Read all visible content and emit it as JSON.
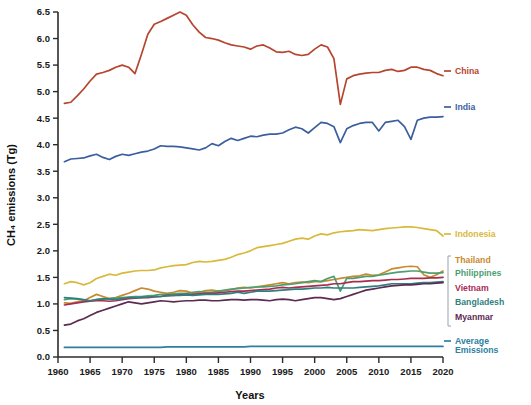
{
  "chart_data": {
    "type": "line",
    "title": "",
    "xlabel": "Years",
    "ylabel": "CH₄ emissions (Tg)",
    "xlim": [
      1960,
      2020
    ],
    "ylim": [
      0.0,
      6.5
    ],
    "xticks": [
      1960,
      1965,
      1970,
      1975,
      1980,
      1985,
      1990,
      1995,
      2000,
      2005,
      2010,
      2015,
      2020
    ],
    "yticks": [
      "0.0",
      "0.5",
      "1.0",
      "1.5",
      "2.0",
      "2.5",
      "3.0",
      "3.5",
      "4.0",
      "4.5",
      "5.0",
      "5.5",
      "6.0",
      "6.5"
    ],
    "grid": false,
    "legend_position": "right-inline",
    "x": [
      1961,
      1962,
      1963,
      1964,
      1965,
      1966,
      1967,
      1968,
      1969,
      1970,
      1971,
      1972,
      1973,
      1974,
      1975,
      1976,
      1977,
      1978,
      1979,
      1980,
      1981,
      1982,
      1983,
      1984,
      1985,
      1986,
      1987,
      1988,
      1989,
      1990,
      1991,
      1992,
      1993,
      1994,
      1995,
      1996,
      1997,
      1998,
      1999,
      2000,
      2001,
      2002,
      2003,
      2004,
      2005,
      2006,
      2007,
      2008,
      2009,
      2010,
      2011,
      2012,
      2013,
      2014,
      2015,
      2016,
      2017,
      2018,
      2019,
      2020
    ],
    "series": [
      {
        "name": "China",
        "color": "#b5452f",
        "values": [
          4.78,
          4.8,
          4.92,
          5.05,
          5.2,
          5.33,
          5.36,
          5.4,
          5.46,
          5.5,
          5.46,
          5.34,
          5.7,
          6.08,
          6.27,
          6.32,
          6.38,
          6.44,
          6.5,
          6.44,
          6.26,
          6.12,
          6.02,
          6.0,
          5.97,
          5.92,
          5.88,
          5.86,
          5.84,
          5.8,
          5.86,
          5.88,
          5.82,
          5.75,
          5.74,
          5.76,
          5.7,
          5.68,
          5.7,
          5.8,
          5.88,
          5.84,
          5.62,
          4.76,
          5.24,
          5.3,
          5.33,
          5.35,
          5.36,
          5.36,
          5.4,
          5.42,
          5.38,
          5.4,
          5.46,
          5.46,
          5.42,
          5.4,
          5.34,
          5.3
        ]
      },
      {
        "name": "India",
        "color": "#3b5f9e",
        "values": [
          3.68,
          3.73,
          3.74,
          3.75,
          3.79,
          3.82,
          3.76,
          3.72,
          3.78,
          3.82,
          3.8,
          3.83,
          3.86,
          3.88,
          3.92,
          3.98,
          3.97,
          3.97,
          3.96,
          3.94,
          3.92,
          3.9,
          3.94,
          4.02,
          3.98,
          4.06,
          4.12,
          4.08,
          4.12,
          4.16,
          4.15,
          4.18,
          4.2,
          4.2,
          4.22,
          4.28,
          4.33,
          4.3,
          4.22,
          4.32,
          4.42,
          4.4,
          4.34,
          4.04,
          4.3,
          4.36,
          4.4,
          4.42,
          4.42,
          4.26,
          4.42,
          4.44,
          4.46,
          4.34,
          4.1,
          4.46,
          4.5,
          4.52,
          4.52,
          4.53
        ]
      },
      {
        "name": "Indonesia",
        "color": "#d9b93c",
        "values": [
          1.38,
          1.42,
          1.4,
          1.36,
          1.4,
          1.48,
          1.52,
          1.56,
          1.54,
          1.58,
          1.6,
          1.62,
          1.63,
          1.63,
          1.64,
          1.68,
          1.7,
          1.72,
          1.73,
          1.74,
          1.78,
          1.8,
          1.79,
          1.8,
          1.82,
          1.84,
          1.88,
          1.93,
          1.96,
          2.0,
          2.06,
          2.08,
          2.1,
          2.12,
          2.14,
          2.18,
          2.22,
          2.24,
          2.22,
          2.28,
          2.32,
          2.3,
          2.34,
          2.36,
          2.37,
          2.38,
          2.4,
          2.39,
          2.38,
          2.4,
          2.42,
          2.43,
          2.44,
          2.45,
          2.45,
          2.44,
          2.42,
          2.4,
          2.38,
          2.28
        ]
      },
      {
        "name": "Thailand",
        "color": "#c98a2e",
        "values": [
          1.02,
          1.01,
          1.04,
          1.06,
          1.12,
          1.18,
          1.14,
          1.1,
          1.12,
          1.16,
          1.2,
          1.25,
          1.3,
          1.28,
          1.24,
          1.22,
          1.2,
          1.22,
          1.25,
          1.24,
          1.2,
          1.22,
          1.25,
          1.26,
          1.24,
          1.25,
          1.27,
          1.3,
          1.31,
          1.3,
          1.32,
          1.34,
          1.36,
          1.38,
          1.4,
          1.38,
          1.4,
          1.41,
          1.4,
          1.42,
          1.42,
          1.44,
          1.46,
          1.48,
          1.5,
          1.52,
          1.53,
          1.56,
          1.54,
          1.55,
          1.6,
          1.66,
          1.68,
          1.7,
          1.71,
          1.7,
          1.55,
          1.5,
          1.55,
          1.62
        ]
      },
      {
        "name": "Philippines",
        "color": "#4e9e72",
        "values": [
          1.08,
          1.1,
          1.09,
          1.07,
          1.06,
          1.08,
          1.09,
          1.1,
          1.11,
          1.12,
          1.13,
          1.14,
          1.14,
          1.15,
          1.16,
          1.18,
          1.18,
          1.19,
          1.2,
          1.2,
          1.22,
          1.23,
          1.22,
          1.22,
          1.24,
          1.26,
          1.28,
          1.29,
          1.3,
          1.31,
          1.32,
          1.32,
          1.33,
          1.34,
          1.36,
          1.37,
          1.38,
          1.4,
          1.42,
          1.44,
          1.42,
          1.48,
          1.52,
          1.24,
          1.48,
          1.48,
          1.5,
          1.52,
          1.52,
          1.54,
          1.56,
          1.58,
          1.6,
          1.61,
          1.62,
          1.62,
          1.6,
          1.58,
          1.58,
          1.59
        ]
      },
      {
        "name": "Vietnam",
        "color": "#a82c52",
        "values": [
          0.98,
          1.0,
          1.02,
          1.04,
          1.05,
          1.06,
          1.06,
          1.05,
          1.06,
          1.08,
          1.1,
          1.11,
          1.12,
          1.12,
          1.13,
          1.14,
          1.16,
          1.16,
          1.17,
          1.18,
          1.18,
          1.19,
          1.2,
          1.2,
          1.21,
          1.22,
          1.23,
          1.24,
          1.24,
          1.25,
          1.26,
          1.27,
          1.28,
          1.3,
          1.31,
          1.3,
          1.31,
          1.32,
          1.33,
          1.34,
          1.35,
          1.36,
          1.38,
          1.38,
          1.4,
          1.42,
          1.42,
          1.43,
          1.44,
          1.44,
          1.45,
          1.46,
          1.46,
          1.47,
          1.48,
          1.48,
          1.48,
          1.49,
          1.49,
          1.5
        ]
      },
      {
        "name": "Bangladesh",
        "color": "#2f7f7f",
        "values": [
          1.12,
          1.11,
          1.1,
          1.08,
          1.06,
          1.08,
          1.1,
          1.09,
          1.08,
          1.1,
          1.12,
          1.12,
          1.12,
          1.13,
          1.14,
          1.14,
          1.15,
          1.16,
          1.16,
          1.17,
          1.16,
          1.17,
          1.18,
          1.18,
          1.18,
          1.19,
          1.2,
          1.22,
          1.2,
          1.22,
          1.24,
          1.24,
          1.24,
          1.25,
          1.26,
          1.27,
          1.28,
          1.28,
          1.29,
          1.3,
          1.3,
          1.31,
          1.3,
          1.3,
          1.3,
          1.3,
          1.31,
          1.32,
          1.33,
          1.34,
          1.36,
          1.38,
          1.38,
          1.38,
          1.38,
          1.39,
          1.4,
          1.4,
          1.41,
          1.42
        ]
      },
      {
        "name": "Myanmar",
        "color": "#5c2b52",
        "values": [
          0.6,
          0.62,
          0.68,
          0.72,
          0.78,
          0.84,
          0.88,
          0.92,
          0.96,
          1.0,
          1.04,
          1.02,
          1.0,
          1.02,
          1.04,
          1.06,
          1.05,
          1.04,
          1.05,
          1.06,
          1.06,
          1.07,
          1.07,
          1.06,
          1.06,
          1.07,
          1.08,
          1.08,
          1.07,
          1.08,
          1.08,
          1.07,
          1.06,
          1.08,
          1.09,
          1.08,
          1.06,
          1.08,
          1.1,
          1.12,
          1.12,
          1.1,
          1.08,
          1.1,
          1.14,
          1.18,
          1.22,
          1.26,
          1.28,
          1.3,
          1.32,
          1.34,
          1.35,
          1.36,
          1.36,
          1.37,
          1.38,
          1.38,
          1.39,
          1.4
        ]
      },
      {
        "name": "Average Emissions",
        "color": "#2e7fa0",
        "values": [
          0.18,
          0.18,
          0.18,
          0.18,
          0.18,
          0.18,
          0.18,
          0.18,
          0.18,
          0.18,
          0.18,
          0.18,
          0.18,
          0.18,
          0.18,
          0.18,
          0.19,
          0.19,
          0.19,
          0.19,
          0.19,
          0.19,
          0.19,
          0.19,
          0.19,
          0.19,
          0.19,
          0.19,
          0.19,
          0.2,
          0.2,
          0.2,
          0.2,
          0.2,
          0.2,
          0.2,
          0.2,
          0.2,
          0.2,
          0.2,
          0.2,
          0.2,
          0.2,
          0.2,
          0.2,
          0.2,
          0.2,
          0.2,
          0.2,
          0.2,
          0.2,
          0.2,
          0.2,
          0.2,
          0.2,
          0.2,
          0.2,
          0.2,
          0.2,
          0.2
        ]
      }
    ],
    "legend": [
      {
        "label": "China",
        "color": "#b5452f"
      },
      {
        "label": "India",
        "color": "#3b5f9e"
      },
      {
        "label": "Indonesia",
        "color": "#d9b93c"
      },
      {
        "label": "Thailand",
        "color": "#c98a2e"
      },
      {
        "label": "Philippines",
        "color": "#4e9e72"
      },
      {
        "label": "Vietnam",
        "color": "#a82c52"
      },
      {
        "label": "Bangladesh",
        "color": "#2f7f7f"
      },
      {
        "label": "Myanmar",
        "color": "#5c2b52"
      },
      {
        "label": "Average",
        "color": "#2e7fa0"
      },
      {
        "label": "Emissions",
        "color": "#2e7fa0"
      }
    ]
  }
}
